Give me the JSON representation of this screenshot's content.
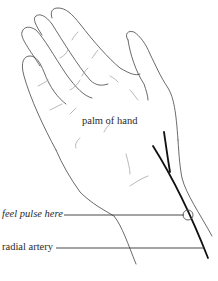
{
  "diagram": {
    "labels": {
      "palm": "palm of hand",
      "pulse": "feel pulse here",
      "artery": "radial artery"
    },
    "colors": {
      "background": "#ffffff",
      "outline": "#444444",
      "artery": "#111111",
      "text": "#2a2a2a"
    }
  }
}
